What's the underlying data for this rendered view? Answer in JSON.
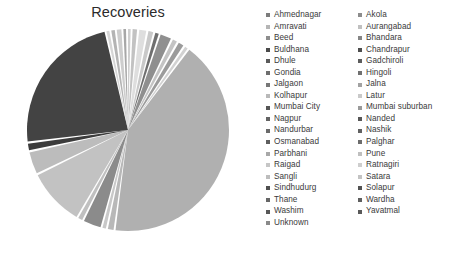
{
  "chart_data": {
    "type": "pie",
    "title": "Recoveries",
    "xlabel": "",
    "ylabel": "",
    "legend_position": "right",
    "legend_columns": 2,
    "grid": false,
    "categories": [
      "Ahmednagar",
      "Akola",
      "Amravati",
      "Aurangabad",
      "Beed",
      "Bhandara",
      "Buldhana",
      "Chandrapur",
      "Dhule",
      "Gadchiroli",
      "Gondia",
      "Hingoli",
      "Jalgaon",
      "Jalna",
      "Kolhapur",
      "Latur",
      "Mumbai City",
      "Mumbai suburban",
      "Nagpur",
      "Nanded",
      "Nandurbar",
      "Nashik",
      "Osmanabad",
      "Palghar",
      "Parbhani",
      "Pune",
      "Raigad",
      "Ratnagiri",
      "Sangli",
      "Satara",
      "Sindhudurg",
      "Solapur",
      "Thane",
      "Wardha",
      "Washim",
      "Yavatmal",
      "Unknown"
    ],
    "values": [
      0.7,
      0.5,
      0.4,
      2.6,
      0.4,
      0.2,
      0.5,
      0.5,
      0.5,
      0.2,
      0.3,
      0.2,
      0.6,
      0.3,
      0.5,
      0.6,
      18.2,
      4.6,
      2.1,
      0.5,
      0.2,
      3.2,
      0.3,
      2.4,
      0.3,
      9.8,
      1.2,
      0.4,
      0.5,
      0.6,
      0.2,
      1.4,
      33.2,
      0.2,
      0.2,
      0.5,
      0.3
    ],
    "slice_colors": [
      "#bdbdbd",
      "#9e9e9e",
      "#d4d4d4",
      "#7d7d7d",
      "#c8c8c8",
      "#a6a6a6",
      "#e0e0e0",
      "#8f8f8f",
      "#b5b5b5",
      "#d9d9d9",
      "#8a8a8a",
      "#cfcfcf",
      "#a0a0a0",
      "#c2c2c2",
      "#949494",
      "#dcdcdc",
      "#3f3f3f",
      "#b0b0b0",
      "#868686",
      "#c6c6c6",
      "#e2e2e2",
      "#999999",
      "#d0d0d0",
      "#acacac",
      "#bbbbbb",
      "#8b8b8b",
      "#cbcbcb",
      "#dfdfdf",
      "#a9a9a9",
      "#c4c4c4",
      "#efefef",
      "#979797",
      "#b9b9b9",
      "#7a7a7a",
      "#d6d6d6",
      "#a3a3a3",
      "#e6e6e6"
    ]
  },
  "legend": {
    "column_one": [
      {
        "label": "Ahmednagar",
        "color": "#7c7c7c"
      },
      {
        "label": "Amravati",
        "color": "#b5b5b5"
      },
      {
        "label": "Beed",
        "color": "#8e8e8e"
      },
      {
        "label": "Buldhana",
        "color": "#4a4a4a"
      },
      {
        "label": "Dhule",
        "color": "#5a5a5a"
      },
      {
        "label": "Gondia",
        "color": "#6e6e6e"
      },
      {
        "label": "Jalgaon",
        "color": "#777777"
      },
      {
        "label": "Kolhapur",
        "color": "#b9b9b9"
      },
      {
        "label": "Mumbai City",
        "color": "#555555"
      },
      {
        "label": "Nagpur",
        "color": "#636363"
      },
      {
        "label": "Nandurbar",
        "color": "#6a6a6a"
      },
      {
        "label": "Osmanabad",
        "color": "#5e5e5e"
      },
      {
        "label": "Parbhani",
        "color": "#a8a8a8"
      },
      {
        "label": "Raigad",
        "color": "#c6c6c6"
      },
      {
        "label": "Sangli",
        "color": "#bdbdbd"
      },
      {
        "label": "Sindhudurg",
        "color": "#4f4f4f"
      },
      {
        "label": "Thane",
        "color": "#666666"
      },
      {
        "label": "Washim",
        "color": "#585858"
      },
      {
        "label": "Unknown",
        "color": "#8a8a8a"
      }
    ],
    "column_two": [
      {
        "label": "Akola",
        "color": "#8c8c8c"
      },
      {
        "label": "Aurangabad",
        "color": "#c0c0c0"
      },
      {
        "label": "Bhandara",
        "color": "#858585"
      },
      {
        "label": "Chandrapur",
        "color": "#4d4d4d"
      },
      {
        "label": "Gadchiroli",
        "color": "#5c5c5c"
      },
      {
        "label": "Hingoli",
        "color": "#707070"
      },
      {
        "label": "Jalna",
        "color": "#a2a2a2"
      },
      {
        "label": "Latur",
        "color": "#c9c9c9"
      },
      {
        "label": "Mumbai suburban",
        "color": "#9a9a9a"
      },
      {
        "label": "Nanded",
        "color": "#565656"
      },
      {
        "label": "Nashik",
        "color": "#616161"
      },
      {
        "label": "Palghar",
        "color": "#6c6c6c"
      },
      {
        "label": "Pune",
        "color": "#bfbfbf"
      },
      {
        "label": "Ratnagiri",
        "color": "#cecece"
      },
      {
        "label": "Satara",
        "color": "#c3c3c3"
      },
      {
        "label": "Solapur",
        "color": "#525252"
      },
      {
        "label": "Wardha",
        "color": "#5f5f5f"
      },
      {
        "label": "Yavatmal",
        "color": "#595959"
      }
    ]
  },
  "pie_geometry": {
    "center_x": 102,
    "center_y": 102,
    "radius": 101,
    "start_angle_deg": -90,
    "slices": [
      {
        "name": "s01",
        "sweep": 1.2,
        "color": "#cfcfcf"
      },
      {
        "name": "s02",
        "sweep": 0.9,
        "color": "#ffffff"
      },
      {
        "name": "s03",
        "sweep": 2.0,
        "color": "#c2c2c2"
      },
      {
        "name": "s04",
        "sweep": 1.0,
        "color": "#ffffff"
      },
      {
        "name": "s05",
        "sweep": 3.2,
        "color": "#dedede"
      },
      {
        "name": "s06",
        "sweep": 1.0,
        "color": "#ffffff"
      },
      {
        "name": "s07",
        "sweep": 2.2,
        "color": "#c9c9c9"
      },
      {
        "name": "s08",
        "sweep": 1.0,
        "color": "#ffffff"
      },
      {
        "name": "s09",
        "sweep": 1.6,
        "color": "#6f6f6f"
      },
      {
        "name": "s10",
        "sweep": 0.9,
        "color": "#ffffff"
      },
      {
        "name": "s11",
        "sweep": 5.0,
        "color": "#8f8f8f"
      },
      {
        "name": "s12",
        "sweep": 1.0,
        "color": "#ffffff"
      },
      {
        "name": "s13",
        "sweep": 2.0,
        "color": "#c4c4c4"
      },
      {
        "name": "s14",
        "sweep": 1.0,
        "color": "#ffffff"
      },
      {
        "name": "s15",
        "sweep": 2.4,
        "color": "#9b9b9b"
      },
      {
        "name": "s16",
        "sweep": 1.0,
        "color": "#ffffff"
      },
      {
        "name": "s17",
        "sweep": 1.4,
        "color": "#d2d2d2"
      },
      {
        "name": "s18",
        "sweep": 0.9,
        "color": "#ffffff"
      },
      {
        "name": "s19",
        "sweep": 119.0,
        "color": "#b0b0b0"
      },
      {
        "name": "s20",
        "sweep": 0.9,
        "color": "#ffffff"
      },
      {
        "name": "s21",
        "sweep": 2.6,
        "color": "#b8b8b8"
      },
      {
        "name": "s22",
        "sweep": 0.9,
        "color": "#ffffff"
      },
      {
        "name": "s23",
        "sweep": 1.6,
        "color": "#c8c8c8"
      },
      {
        "name": "s24",
        "sweep": 0.9,
        "color": "#ffffff"
      },
      {
        "name": "s25",
        "sweep": 8.0,
        "color": "#8b8b8b"
      },
      {
        "name": "s26",
        "sweep": 0.9,
        "color": "#ffffff"
      },
      {
        "name": "s27",
        "sweep": 2.0,
        "color": "#c0c0c0"
      },
      {
        "name": "s28",
        "sweep": 0.9,
        "color": "#ffffff"
      },
      {
        "name": "s29",
        "sweep": 26.0,
        "color": "#c2c2c2"
      },
      {
        "name": "s30",
        "sweep": 1.0,
        "color": "#ffffff"
      },
      {
        "name": "s31",
        "sweep": 10.0,
        "color": "#bcbcbc"
      },
      {
        "name": "s32",
        "sweep": 1.0,
        "color": "#ffffff"
      },
      {
        "name": "s33",
        "sweep": 3.0,
        "color": "#3c3c3c"
      },
      {
        "name": "s34",
        "sweep": 1.0,
        "color": "#ffffff"
      },
      {
        "name": "s35",
        "sweep": 66.0,
        "color": "#434343"
      },
      {
        "name": "s36",
        "sweep": 0.9,
        "color": "#ffffff"
      },
      {
        "name": "s37",
        "sweep": 1.3,
        "color": "#d6d6d6"
      },
      {
        "name": "s38",
        "sweep": 0.9,
        "color": "#ffffff"
      },
      {
        "name": "s39",
        "sweep": 1.6,
        "color": "#b4b4b4"
      },
      {
        "name": "s40",
        "sweep": 0.9,
        "color": "#ffffff"
      },
      {
        "name": "s41",
        "sweep": 2.1,
        "color": "#cdcdcd"
      },
      {
        "name": "s42",
        "sweep": 0.9,
        "color": "#ffffff"
      },
      {
        "name": "s43",
        "sweep": 1.2,
        "color": "#a7a7a7"
      },
      {
        "name": "s44",
        "sweep": 0.9,
        "color": "#ffffff"
      },
      {
        "name": "s45",
        "sweep": 0.0,
        "color": "#ffffff"
      }
    ]
  }
}
